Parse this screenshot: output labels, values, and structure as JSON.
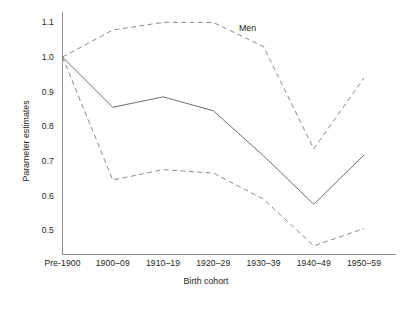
{
  "chart_data": {
    "type": "line",
    "title": "",
    "annotation": "Men",
    "xlabel": "Birth cohort",
    "ylabel": "Parameter estimates",
    "categories": [
      "Pre-1900",
      "1900–09",
      "1910–19",
      "1920–29",
      "1930–39",
      "1940–49",
      "1950–59"
    ],
    "yticks": [
      "1.1",
      "1.0",
      "0.9",
      "0.8",
      "0.7",
      "0.6",
      "0.5"
    ],
    "ytick_values": [
      1.1,
      1.0,
      0.9,
      0.8,
      0.7,
      0.6,
      0.5
    ],
    "ylim": [
      0.43,
      1.13
    ],
    "grid": false,
    "legend": "none",
    "series": [
      {
        "name": "Parameter estimate",
        "style": "solid",
        "values": [
          1.0,
          0.855,
          0.885,
          0.845,
          0.715,
          0.575,
          0.717
        ]
      },
      {
        "name": "Upper 95% confidence limit",
        "style": "dashed",
        "values": [
          1.0,
          1.078,
          1.1,
          1.1,
          1.03,
          0.735,
          0.94
        ]
      },
      {
        "name": "Lower 95% confidence limit",
        "style": "dashed",
        "values": [
          1.0,
          0.645,
          0.675,
          0.665,
          0.59,
          0.455,
          0.505
        ]
      }
    ]
  },
  "colors": {
    "solid_line": "#6e6e6e",
    "dashed_line": "#8a8a8a",
    "axis": "#8c8c8c",
    "text": "#231f20",
    "background": "#ffffff"
  }
}
